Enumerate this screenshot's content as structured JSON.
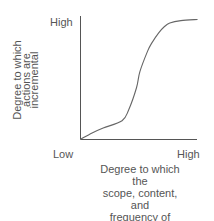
{
  "chart_data": {
    "type": "line",
    "title": "",
    "xlabel": "Degree to which the scope, content, and frequency of choice are limited",
    "ylabel": "Degree to which actions are incremental",
    "x_ticks": [
      "Low",
      "High"
    ],
    "y_ticks": [
      "High"
    ],
    "series": [
      {
        "name": "curve",
        "x": [
          0.0,
          0.1,
          0.2,
          0.37,
          0.43,
          0.5,
          0.53,
          0.6,
          0.64,
          0.7,
          0.75,
          0.8,
          0.9,
          1.05
        ],
        "y": [
          0.0,
          0.05,
          0.09,
          0.15,
          0.24,
          0.42,
          0.55,
          0.72,
          0.79,
          0.87,
          0.92,
          0.95,
          0.97,
          0.98
        ]
      }
    ],
    "grid": false,
    "legend": "none"
  },
  "labels": {
    "y_high": "High",
    "x_low": "Low",
    "x_high": "High",
    "y_axis_lines": [
      "Degree to which",
      "actions are",
      "incremental"
    ],
    "x_axis_lines": [
      "Degree to which the",
      "scope, content, and",
      "frequency of choice",
      "are limited"
    ]
  },
  "colors": {
    "axis": "#555555",
    "curve": "#666666",
    "text": "#555555"
  }
}
